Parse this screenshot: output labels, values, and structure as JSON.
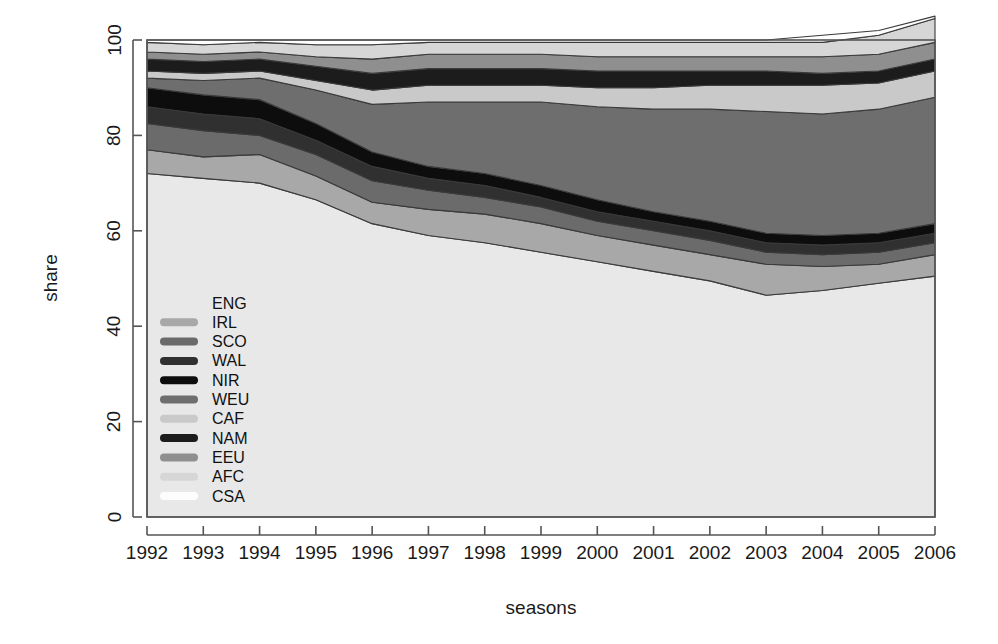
{
  "chart_data": {
    "type": "area",
    "stacked": true,
    "title": "",
    "xlabel": "seasons",
    "ylabel": "share",
    "x": [
      1992,
      1993,
      1994,
      1995,
      1996,
      1997,
      1998,
      1999,
      2000,
      2001,
      2002,
      2003,
      2004,
      2005,
      2006
    ],
    "categories": [
      "1992",
      "1993",
      "1994",
      "1995",
      "1996",
      "1997",
      "1998",
      "1999",
      "2000",
      "2001",
      "2002",
      "2003",
      "2004",
      "2005",
      "2006"
    ],
    "xlim": [
      1992,
      2006
    ],
    "ylim": [
      0,
      100
    ],
    "xticks": [
      1992,
      1993,
      1994,
      1995,
      1996,
      1997,
      1998,
      1999,
      2000,
      2001,
      2002,
      2003,
      2004,
      2005,
      2006
    ],
    "yticks": [
      0,
      20,
      40,
      60,
      80,
      100
    ],
    "grid": false,
    "legend_position": "inside-lower-left",
    "stack_order_bottom_to_top": [
      "ENG",
      "IRL",
      "SCO",
      "WAL",
      "NIR",
      "WEU",
      "CAF",
      "NAM",
      "EEU",
      "AFC",
      "CSA"
    ],
    "series": [
      {
        "name": "ENG",
        "color": "#e8e8e8",
        "values": [
          72.0,
          71.0,
          70.0,
          66.5,
          61.5,
          59.0,
          57.5,
          55.5,
          53.5,
          51.5,
          49.5,
          46.5,
          47.5,
          49.0,
          50.5
        ]
      },
      {
        "name": "IRL",
        "color": "#a8a8a8",
        "values": [
          5.0,
          4.5,
          6.0,
          5.0,
          4.5,
          5.5,
          6.0,
          6.0,
          5.5,
          5.5,
          5.5,
          6.5,
          5.0,
          4.0,
          4.5
        ]
      },
      {
        "name": "SCO",
        "color": "#6b6b6b",
        "values": [
          5.5,
          5.5,
          4.0,
          4.5,
          4.5,
          4.0,
          3.5,
          3.5,
          3.0,
          3.0,
          3.0,
          2.5,
          2.5,
          2.5,
          2.5
        ]
      },
      {
        "name": "WAL",
        "color": "#303030",
        "values": [
          3.5,
          3.5,
          3.5,
          3.0,
          3.0,
          2.5,
          2.5,
          2.0,
          2.0,
          2.0,
          2.0,
          2.0,
          2.0,
          2.0,
          2.0
        ]
      },
      {
        "name": "NIR",
        "color": "#0d0d0d",
        "values": [
          4.0,
          4.0,
          4.0,
          3.5,
          3.0,
          2.5,
          2.5,
          2.5,
          2.5,
          2.0,
          2.0,
          2.0,
          2.0,
          2.0,
          2.0
        ]
      },
      {
        "name": "WEU",
        "color": "#6e6e6e",
        "values": [
          2.0,
          3.0,
          4.5,
          7.0,
          10.0,
          13.5,
          15.0,
          17.5,
          19.5,
          21.5,
          23.5,
          25.5,
          25.5,
          26.0,
          26.5
        ]
      },
      {
        "name": "CAF",
        "color": "#c9c9c9",
        "values": [
          1.5,
          1.5,
          1.5,
          2.0,
          3.0,
          3.5,
          3.5,
          3.5,
          4.0,
          4.5,
          5.0,
          5.5,
          6.0,
          5.5,
          5.5
        ]
      },
      {
        "name": "NAM",
        "color": "#1c1c1c",
        "values": [
          2.5,
          2.5,
          2.5,
          3.0,
          3.5,
          3.5,
          3.5,
          3.5,
          3.5,
          3.5,
          3.0,
          3.0,
          2.5,
          2.5,
          2.5
        ]
      },
      {
        "name": "EEU",
        "color": "#8f8f8f",
        "values": [
          1.5,
          1.5,
          1.5,
          2.0,
          3.0,
          3.0,
          3.0,
          3.0,
          3.0,
          3.0,
          3.0,
          3.0,
          3.5,
          3.5,
          3.5
        ]
      },
      {
        "name": "AFC",
        "color": "#d6d6d6",
        "values": [
          2.0,
          2.0,
          2.0,
          2.5,
          3.0,
          2.5,
          2.5,
          2.5,
          3.0,
          3.0,
          3.0,
          3.0,
          3.0,
          4.0,
          5.0
        ]
      },
      {
        "name": "CSA",
        "color": "#fdfdfd",
        "values": [
          0.5,
          1.0,
          0.5,
          1.0,
          1.0,
          0.5,
          0.5,
          0.5,
          0.5,
          0.5,
          0.5,
          0.5,
          1.5,
          1.0,
          0.5
        ]
      }
    ],
    "legend_entries": [
      {
        "label": "ENG",
        "color": "#e8e8e8"
      },
      {
        "label": "IRL",
        "color": "#a8a8a8"
      },
      {
        "label": "SCO",
        "color": "#6b6b6b"
      },
      {
        "label": "WAL",
        "color": "#303030"
      },
      {
        "label": "NIR",
        "color": "#0d0d0d"
      },
      {
        "label": "WEU",
        "color": "#6e6e6e"
      },
      {
        "label": "CAF",
        "color": "#c9c9c9"
      },
      {
        "label": "NAM",
        "color": "#1c1c1c"
      },
      {
        "label": "EEU",
        "color": "#8f8f8f"
      },
      {
        "label": "AFC",
        "color": "#d6d6d6"
      },
      {
        "label": "CSA",
        "color": "#fdfdfd"
      }
    ]
  },
  "axes": {
    "x_title": "seasons",
    "y_title": "share",
    "axis_color": "#555555",
    "border_color": "#555555"
  },
  "canvas": {
    "background": "#ffffff"
  }
}
